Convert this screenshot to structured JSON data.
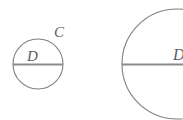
{
  "figure": {
    "background_color": "#ffffff",
    "stroke_color": "#807f82",
    "diameter_color": "#8a8a8d",
    "label_color": "#5d5c60",
    "shapes": [
      {
        "name": "small-circle",
        "center_x": 38,
        "center_y": 64,
        "radius": 25,
        "inner_label": "D",
        "outer_label": "C"
      },
      {
        "name": "large-circle",
        "center_x": 177,
        "center_y": 64,
        "radius": 55,
        "inner_label": "D",
        "outer_label": ""
      }
    ]
  },
  "labels": {
    "small_circle_inner": "D",
    "small_circle_outer": "C",
    "large_circle_inner": "D"
  }
}
